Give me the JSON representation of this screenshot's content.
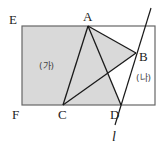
{
  "diagram": {
    "type": "geometry",
    "colors": {
      "background": "#ffffff",
      "shade": "#d9d9d9",
      "rect_stroke": "#666666",
      "line_stroke": "#1a1a1a"
    },
    "points": {
      "E": {
        "label": "E",
        "x": 22,
        "y": 26
      },
      "A": {
        "label": "A",
        "x": 88,
        "y": 26
      },
      "B": {
        "label": "B",
        "x": 136,
        "y": 53
      },
      "C": {
        "label": "C",
        "x": 63,
        "y": 105
      },
      "D": {
        "label": "D",
        "x": 121,
        "y": 105
      },
      "F": {
        "label": "F",
        "x": 22,
        "y": 105
      }
    },
    "rectangle": {
      "x1": 22,
      "y1": 26,
      "x2": 155,
      "y2": 105
    },
    "regions": {
      "ga": {
        "label": "(가)"
      },
      "na": {
        "label": "(나)"
      }
    },
    "line_l": {
      "label": "l"
    }
  }
}
